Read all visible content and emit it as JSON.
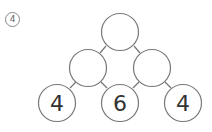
{
  "question_number": "4",
  "tree": {
    "top": {
      "value": ""
    },
    "middle": [
      {
        "value": ""
      },
      {
        "value": ""
      }
    ],
    "bottom": [
      {
        "value": "4"
      },
      {
        "value": "6"
      },
      {
        "value": "4"
      }
    ]
  },
  "colors": {
    "stroke": "#777777",
    "text": "#333333"
  }
}
